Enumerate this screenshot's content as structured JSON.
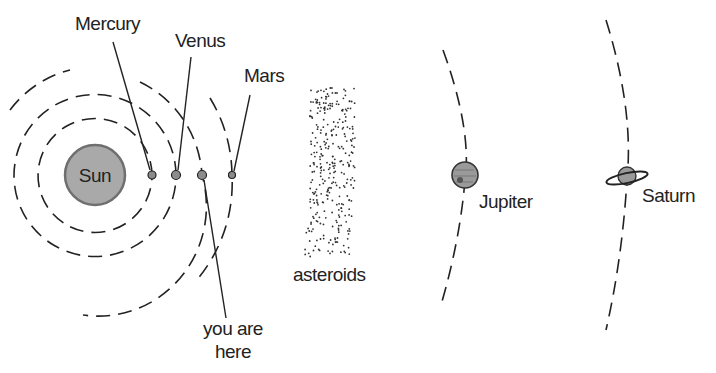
{
  "diagram": {
    "colors": {
      "line": "#222222",
      "sun_fill": "#a9a9a9",
      "planet_fill": "#8c8c8c",
      "background": "#ffffff"
    },
    "sun": {
      "label": "Sun"
    },
    "planets": [
      {
        "name": "Mercury",
        "label": "Mercury"
      },
      {
        "name": "Venus",
        "label": "Venus"
      },
      {
        "name": "Earth",
        "label": "you are here",
        "label_line1": "you are",
        "label_line2": "here"
      },
      {
        "name": "Mars",
        "label": "Mars"
      },
      {
        "name": "Jupiter",
        "label": "Jupiter"
      },
      {
        "name": "Saturn",
        "label": "Saturn"
      }
    ],
    "asteroid_belt": {
      "label": "asteroids"
    }
  }
}
